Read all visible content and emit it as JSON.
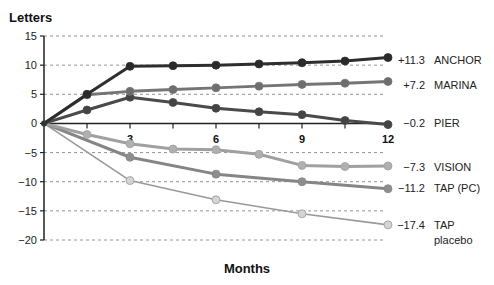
{
  "chart_data": {
    "type": "line",
    "title": "",
    "ylabel": "Letters",
    "xlabel": "Months",
    "ylim": [
      -20,
      15
    ],
    "xlim": [
      0,
      12
    ],
    "yticks": [
      15,
      10,
      5,
      0,
      -5,
      -10,
      -15,
      -20
    ],
    "ytick_labels": [
      "15",
      "10",
      "5",
      "0",
      "−5",
      "−10",
      "−15",
      "−20"
    ],
    "xticks_minor": [
      1.5,
      3,
      4.5,
      6,
      7.5,
      9,
      10.5,
      12
    ],
    "xtick_labels": [
      {
        "x": 3,
        "label": "3"
      },
      {
        "x": 6,
        "label": "6"
      },
      {
        "x": 9,
        "label": "9"
      },
      {
        "x": 12,
        "label": "12"
      }
    ],
    "grid": "horizontal dashed",
    "legend_position": "right (inline end labels)",
    "series": [
      {
        "name": "ANCHOR",
        "end_label": "+11.3",
        "color": "#2e2e2e",
        "marker": "#2a2a2a",
        "x": [
          0,
          1.5,
          3,
          4.5,
          6,
          7.5,
          9,
          10.5,
          12
        ],
        "values": [
          0,
          5.0,
          9.8,
          9.9,
          10.0,
          10.2,
          10.4,
          10.7,
          11.3
        ]
      },
      {
        "name": "MARINA",
        "end_label": "+7.2",
        "color": "#757575",
        "marker": "#6e6e6e",
        "x": [
          0,
          1.5,
          3,
          4.5,
          6,
          7.5,
          9,
          10.5,
          12
        ],
        "values": [
          0,
          4.9,
          5.5,
          5.8,
          6.1,
          6.4,
          6.7,
          6.9,
          7.2
        ]
      },
      {
        "name": "PIER",
        "end_label": "−0.2",
        "color": "#4a4a4a",
        "marker": "#444444",
        "x": [
          0,
          1.5,
          3,
          4.5,
          6,
          7.5,
          9,
          10.5,
          12
        ],
        "values": [
          0,
          2.3,
          4.5,
          3.6,
          2.6,
          2.0,
          1.5,
          0.5,
          -0.2
        ]
      },
      {
        "name": "VISION",
        "end_label": "−7.3",
        "color": "#a0a0a0",
        "marker": "#b0b0b0",
        "x": [
          0,
          1.5,
          3,
          4.5,
          6,
          7.5,
          9,
          10.5,
          12
        ],
        "values": [
          0,
          -1.9,
          -3.5,
          -4.4,
          -4.5,
          -5.3,
          -7.2,
          -7.4,
          -7.3
        ]
      },
      {
        "name": "TAP (PC)",
        "end_label": "−11.2",
        "color": "#858585",
        "marker": "#8e8e8e",
        "x": [
          0,
          3,
          6,
          9,
          12
        ],
        "values": [
          0,
          -5.8,
          -8.7,
          -10.0,
          -11.2
        ]
      },
      {
        "name": "TAP placebo",
        "name_lines": [
          "TAP",
          "placebo"
        ],
        "end_label": "−17.4",
        "color": "#999999",
        "marker": "#d4d4d4",
        "x": [
          0,
          3,
          6,
          9,
          12
        ],
        "values": [
          0,
          -9.8,
          -13.1,
          -15.5,
          -17.4
        ]
      }
    ]
  }
}
